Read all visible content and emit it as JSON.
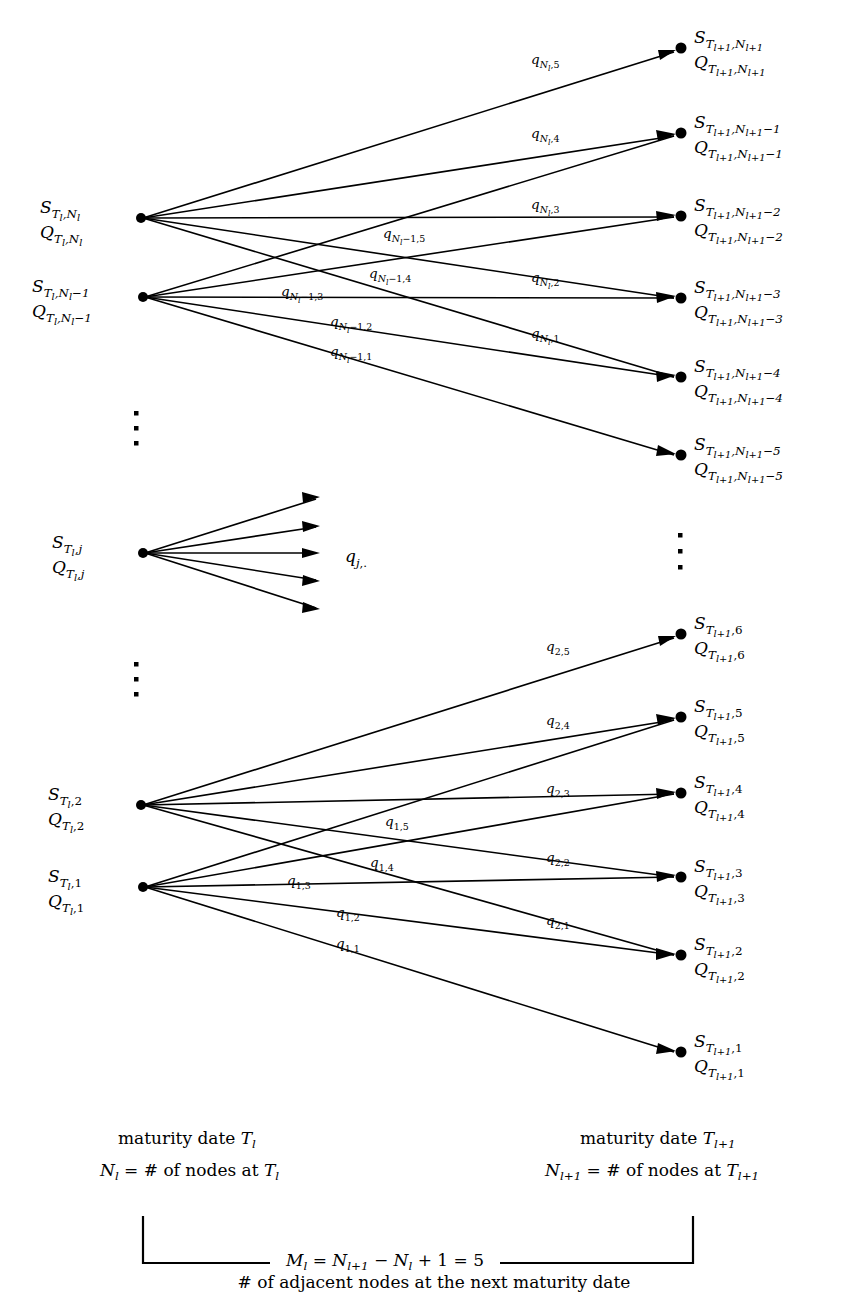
{
  "figure": {
    "type": "lattice-transition-diagram",
    "title_caption": "# of adjacent nodes at the next maturity date",
    "branching_factor": 5
  },
  "left_nodes": [
    {
      "id": "Nl",
      "S_base": "S",
      "S_sub": "T",
      "S_subsub": "l",
      "S_idx": "N",
      "S_idx_sub": "l",
      "S_idx_tail": "",
      "y": 218,
      "label_S": "S",
      "label_Q": "Q"
    },
    {
      "id": "Nl-1",
      "S_base": "S",
      "S_sub": "T",
      "S_subsub": "l",
      "S_idx": "N",
      "S_idx_sub": "l",
      "S_idx_tail": "-1",
      "y": 297,
      "label_S": "S",
      "label_Q": "Q"
    },
    {
      "id": "j",
      "S_base": "S",
      "S_sub": "T",
      "S_subsub": "l",
      "S_idx": "j",
      "S_idx_sub": "",
      "S_idx_tail": "",
      "y": 553,
      "label_S": "S",
      "label_Q": "Q"
    },
    {
      "id": "2",
      "S_base": "S",
      "S_sub": "T",
      "S_subsub": "l",
      "S_idx": "2",
      "S_idx_sub": "",
      "S_idx_tail": "",
      "y": 805,
      "label_S": "S",
      "label_Q": "Q"
    },
    {
      "id": "1",
      "S_base": "S",
      "S_sub": "T",
      "S_subsub": "l",
      "S_idx": "1",
      "S_idx_sub": "",
      "S_idx_tail": "",
      "y": 887,
      "label_S": "S",
      "label_Q": "Q"
    }
  ],
  "right_nodes": [
    {
      "id": "Nl1",
      "tail": "",
      "y": 48
    },
    {
      "id": "Nl1-1",
      "tail": "-1",
      "y": 133
    },
    {
      "id": "Nl1-2",
      "tail": "-2",
      "y": 216
    },
    {
      "id": "Nl1-3",
      "tail": "-3",
      "y": 298
    },
    {
      "id": "Nl1-4",
      "tail": "-4",
      "y": 377
    },
    {
      "id": "Nl1-5",
      "tail": "-5",
      "y": 455
    },
    {
      "id": "6",
      "tail": "",
      "y": 634,
      "plain_index": "6"
    },
    {
      "id": "5",
      "tail": "",
      "y": 717,
      "plain_index": "5"
    },
    {
      "id": "4",
      "tail": "",
      "y": 793,
      "plain_index": "4"
    },
    {
      "id": "3",
      "tail": "",
      "y": 877,
      "plain_index": "3"
    },
    {
      "id": "2",
      "tail": "",
      "y": 955,
      "plain_index": "2"
    },
    {
      "id": "1",
      "tail": "",
      "y": 1052,
      "plain_index": "1"
    }
  ],
  "edge_labels_top": {
    "from_Nl": [
      "q_{N_l,5}",
      "q_{N_l,4}",
      "q_{N_l,3}",
      "q_{N_l,2}",
      "q_{N_l,1}"
    ],
    "from_Nl_1": [
      "q_{N_l-1,5}",
      "q_{N_l-1,4}",
      "q_{N_l-1,3}",
      "q_{N_l-1,2}",
      "q_{N_l-1,1}"
    ]
  },
  "edge_labels_bottom": {
    "from_2": [
      "q_{2,5}",
      "q_{2,4}",
      "q_{2,3}",
      "q_{2,2}",
      "q_{2,1}"
    ],
    "from_1": [
      "q_{1,5}",
      "q_{1,4}",
      "q_{1,3}",
      "q_{1,2}",
      "q_{1,1}"
    ]
  },
  "middle_label": "q_{j,.}",
  "ellipsis": {
    "left_upper": "⋮",
    "left_lower": "⋮",
    "right_middle": "⋮"
  },
  "caption": {
    "left_line1_prefix": "maturity date ",
    "left_line1_sym": "T",
    "left_line1_sub": "l",
    "left_line2_sym": "N",
    "left_line2_sub": "l",
    "left_line2_text": " = # of nodes at ",
    "left_line2_sym2": "T",
    "left_line2_sub2": "l",
    "right_line1_prefix": "maturity date ",
    "right_line1_sym": "T",
    "right_line1_sub": "l+1",
    "right_line2_sym": "N",
    "right_line2_sub": "l+1",
    "right_line2_text": " = # of nodes at ",
    "right_line2_sym2": "T",
    "right_line2_sub2": "l+1",
    "formula_M": "M",
    "formula_M_sub": "l",
    "formula_eq1": " = ",
    "formula_N1": "N",
    "formula_N1_sub": "l+1",
    "formula_minus": " − ",
    "formula_N2": "N",
    "formula_N2_sub": "l",
    "formula_tail": " + 1 = 5",
    "bottom_note": "# of adjacent nodes at the next maturity date"
  },
  "labels_text": {
    "S_symbol": "S",
    "Q_symbol": "Q",
    "q_symbol": "q",
    "T_symbol": "T",
    "N_symbol": "N",
    "l_symbol": "l",
    "l_plus_1": "l+1"
  },
  "colors": {
    "ink": "#000000",
    "paper": "#ffffff"
  }
}
